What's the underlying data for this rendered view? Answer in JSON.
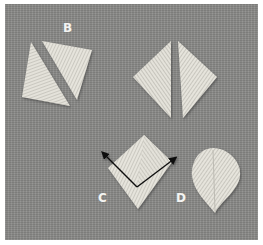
{
  "figure": {
    "background_color": "#8b8b89",
    "thread_color": "#e2e0d8",
    "labels": [
      {
        "id": "B",
        "text": "B"
      },
      {
        "id": "C",
        "text": "C"
      },
      {
        "id": "D",
        "text": "D"
      }
    ],
    "shapes": [
      {
        "name": "square-split-diagonal",
        "label": "B"
      },
      {
        "name": "diamond-split-vertical"
      },
      {
        "name": "fishbone-diamond-with-arrows",
        "label": "C"
      },
      {
        "name": "leaf-satin",
        "label": "D"
      }
    ],
    "arrow_color": "#111111"
  }
}
